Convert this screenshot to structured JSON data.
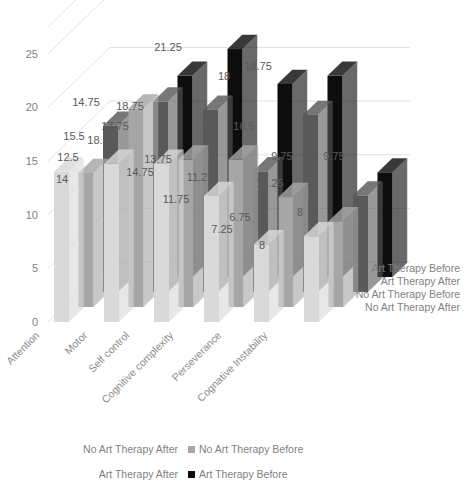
{
  "chart_data": {
    "type": "bar",
    "subtype": "3d-clustered-column",
    "title": "",
    "xlabel": "",
    "ylabel": "",
    "ylim": [
      0,
      27.5
    ],
    "yticks": [
      0,
      5,
      10,
      15,
      20,
      25
    ],
    "ytick_labels": [
      "0",
      "5",
      "10",
      "15",
      "20",
      "25"
    ],
    "grid": true,
    "legend_position": "bottom",
    "categories": [
      "Attention",
      "Motor",
      "Self control",
      "Cognitive complexity",
      "Perseverance",
      "Cognative Instability"
    ],
    "series": [
      {
        "name": "No Art Therapy After",
        "color": "#d9d9d9",
        "label_color": "#bfbfbf",
        "values": [
          14,
          14.75,
          14.75,
          11.75,
          7.25,
          8
        ]
      },
      {
        "name": "No Art Therapy Before",
        "color": "#a6a6a6",
        "label_color": "#808080",
        "values": [
          12.5,
          18.5,
          13.75,
          13.75,
          10.25,
          8
        ]
      },
      {
        "name": "Art Therapy After",
        "color": "#595959",
        "label_color": "#ffffff",
        "values": [
          15.5,
          17.75,
          17,
          11.25,
          16.5,
          9
        ]
      },
      {
        "name": "Art Therapy Before",
        "color": "#0d0d0d",
        "label_color": "#ffffff",
        "values": [
          0,
          18.75,
          21.25,
          18,
          18.75,
          9.75
        ]
      }
    ],
    "outside_labels": [
      {
        "text": "14",
        "x": 62,
        "y": 183
      },
      {
        "text": "12.5",
        "x": 68,
        "y": 161
      },
      {
        "text": "15.5",
        "x": 74,
        "y": 140
      },
      {
        "text": "14.75",
        "x": 86,
        "y": 106
      },
      {
        "text": "18.5",
        "x": 98,
        "y": 144
      },
      {
        "text": "17.75",
        "x": 115,
        "y": 130
      },
      {
        "text": "18.75",
        "x": 130,
        "y": 110
      },
      {
        "text": "14.75",
        "x": 140,
        "y": 176
      },
      {
        "text": "13.75",
        "x": 158,
        "y": 163
      },
      {
        "text": "21.25",
        "x": 168,
        "y": 51
      },
      {
        "text": "11.75",
        "x": 176,
        "y": 203
      },
      {
        "text": "11.25",
        "x": 200,
        "y": 181
      },
      {
        "text": "17",
        "x": 208,
        "y": 122
      },
      {
        "text": "18",
        "x": 224,
        "y": 80
      },
      {
        "text": "7.25",
        "x": 222,
        "y": 233
      },
      {
        "text": "6.75",
        "x": 240,
        "y": 221
      },
      {
        "text": "16.5",
        "x": 244,
        "y": 130
      },
      {
        "text": "18.75",
        "x": 258,
        "y": 70
      },
      {
        "text": "8",
        "x": 262,
        "y": 249
      },
      {
        "text": "10.25",
        "x": 270,
        "y": 187
      },
      {
        "text": "9.75",
        "x": 282,
        "y": 160
      },
      {
        "text": "8",
        "x": 300,
        "y": 216
      },
      {
        "text": "9",
        "x": 314,
        "y": 195
      },
      {
        "text": "9.75",
        "x": 334,
        "y": 160
      }
    ],
    "depth_axis_labels": [
      "Art Therapy Before",
      "Art Therapy After",
      "No Art Therapy Before",
      "No Art Therapy After"
    ],
    "legend": [
      {
        "label": "No Art Therapy After",
        "color": "#d9d9d9"
      },
      {
        "label": "No Art Therapy Before",
        "color": "#a6a6a6"
      },
      {
        "label": "Art Therapy After",
        "color": "#595959"
      },
      {
        "label": "Art Therapy Before",
        "color": "#0d0d0d"
      }
    ]
  },
  "colors": {
    "series_1": "#d9d9d9",
    "series_2": "#a6a6a6",
    "series_3": "#595959",
    "series_4": "#0d0d0d",
    "gridline": "#d9d9d9",
    "tick_text": "#7f7f7f",
    "background": "#ffffff"
  }
}
